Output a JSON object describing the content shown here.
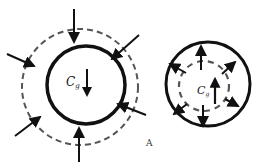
{
  "left_diagram": {
    "label_main": "C",
    "label_sub": "g",
    "description": "compression: arrows pointing inward toward solid circle, dashed outer boundary"
  },
  "right_diagram": {
    "label_main": "C",
    "label_sub": "g",
    "description": "expansion: arrows pointing outward from dashed inner boundary inside solid circle"
  },
  "panel_label": "A",
  "colors": {
    "stroke": "#111111",
    "dashed": "#555555",
    "background": "#ffffff"
  }
}
